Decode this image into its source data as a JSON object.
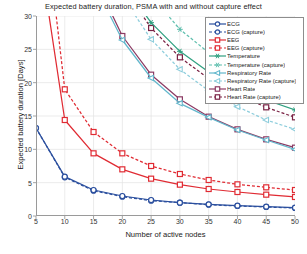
{
  "chart_data": {
    "type": "line",
    "title": "Expected battery duration, PSMA with and without capture effect",
    "xlabel": "Number of active nodes",
    "ylabel": "Expected battery duration [Days]",
    "x": [
      5,
      10,
      15,
      20,
      25,
      30,
      35,
      40,
      45,
      50
    ],
    "xlim": [
      5,
      50
    ],
    "ylim": [
      0,
      30
    ],
    "xticks": [
      5,
      10,
      15,
      20,
      25,
      30,
      35,
      40,
      45,
      50
    ],
    "yticks": [
      0,
      5,
      10,
      15,
      20,
      25,
      30
    ],
    "grid": true,
    "legend_position": "top-right",
    "series": [
      {
        "name": "ECG",
        "color": "#2b4f9e",
        "style": "solid",
        "marker": "circle",
        "values": [
          13.2,
          5.9,
          3.9,
          3.0,
          2.4,
          2.0,
          1.75,
          1.55,
          1.4,
          1.25
        ]
      },
      {
        "name": "ECG (capture)",
        "color": "#2b4f9e",
        "style": "dashed",
        "marker": "circle",
        "values": [
          13.2,
          5.8,
          3.8,
          2.9,
          2.3,
          2.0,
          1.7,
          1.5,
          1.35,
          1.2
        ]
      },
      {
        "name": "EEG",
        "color": "#e02b33",
        "style": "solid",
        "marker": "square",
        "values": [
          43.0,
          14.4,
          9.4,
          7.0,
          5.6,
          4.7,
          4.05,
          3.6,
          3.2,
          2.85
        ]
      },
      {
        "name": "EEG (capture)",
        "color": "#e02b33",
        "style": "dashed",
        "marker": "square",
        "values": [
          56.0,
          19.0,
          12.6,
          9.4,
          7.5,
          6.3,
          5.4,
          4.75,
          4.3,
          3.9
        ]
      },
      {
        "name": "Temperature",
        "color": "#2fa080",
        "style": "solid",
        "marker": "star",
        "values": [
          102.0,
          63.0,
          45.0,
          35.0,
          29.0,
          24.7,
          21.6,
          19.2,
          17.4,
          15.9
        ]
      },
      {
        "name": "Temperature (capture)",
        "color": "#5fbfae",
        "style": "dashed",
        "marker": "star",
        "values": [
          120.0,
          74.0,
          52.0,
          40.5,
          33.0,
          28.0,
          24.5,
          21.8,
          19.6,
          17.9
        ]
      },
      {
        "name": "Respiratory Rate",
        "color": "#62b7cc",
        "style": "solid",
        "marker": "triangle-left",
        "values": [
          78.0,
          48.0,
          35.0,
          26.4,
          20.7,
          16.9,
          14.8,
          12.9,
          11.4,
          10.0
        ]
      },
      {
        "name": "Respiratory Rate (capture)",
        "color": "#8dcddc",
        "style": "dashed",
        "marker": "triangle-left",
        "values": [
          96.0,
          58.0,
          42.0,
          33.0,
          26.5,
          22.0,
          18.8,
          16.4,
          14.4,
          13.0
        ]
      },
      {
        "name": "Heart Rate",
        "color": "#8c3a63",
        "style": "solid",
        "marker": "square",
        "values": [
          80.0,
          49.0,
          36.0,
          27.0,
          21.2,
          17.5,
          14.9,
          13.0,
          11.5,
          10.25
        ]
      },
      {
        "name": "Heart Rate (capture)",
        "color": "#7a2244",
        "style": "dashed",
        "marker": "square",
        "values": [
          99.0,
          60.0,
          44.0,
          34.5,
          28.2,
          23.8,
          20.6,
          18.2,
          16.3,
          14.8
        ]
      }
    ]
  }
}
